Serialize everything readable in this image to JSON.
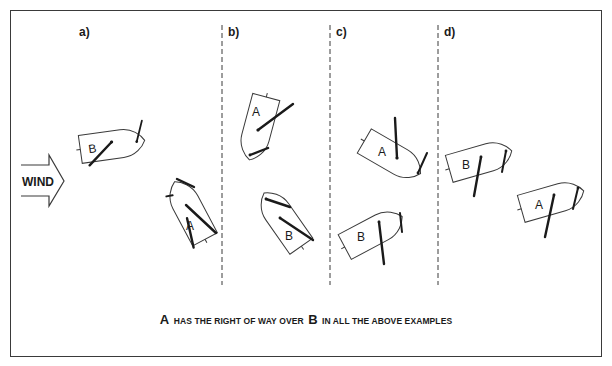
{
  "diagram": {
    "panels": [
      {
        "id": "a",
        "label": "a)",
        "boats": [
          {
            "letter": "B"
          },
          {
            "letter": "A"
          }
        ]
      },
      {
        "id": "b",
        "label": "b)",
        "boats": [
          {
            "letter": "A"
          },
          {
            "letter": "B"
          }
        ]
      },
      {
        "id": "c",
        "label": "c)",
        "boats": [
          {
            "letter": "A"
          },
          {
            "letter": "B"
          }
        ]
      },
      {
        "id": "d",
        "label": "d)",
        "boats": [
          {
            "letter": "B"
          },
          {
            "letter": "A"
          }
        ]
      }
    ],
    "wind_arrow": {
      "label": "WIND",
      "direction": "right"
    },
    "caption": {
      "part1": "A",
      "part2": "HAS THE RIGHT OF WAY OVER",
      "part3": "B",
      "part4": "IN ALL THE ABOVE EXAMPLES"
    },
    "colors": {
      "ink": "#1a1a1a",
      "outline": "#3a3a3a",
      "background": "#ffffff"
    }
  }
}
